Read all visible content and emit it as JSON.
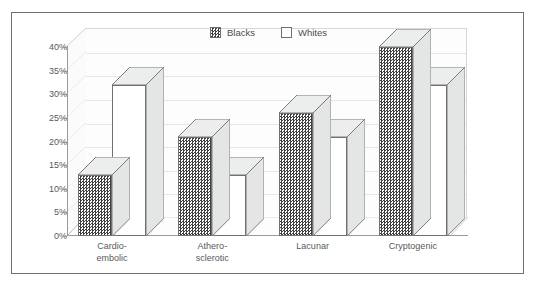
{
  "chart_data": {
    "type": "bar",
    "title": "",
    "subtitle": "",
    "xlabel": "",
    "ylabel": "",
    "categories": [
      "Cardio-\nembolic",
      "Athero-\nsclerotic",
      "Lacunar",
      "Cryptogenic"
    ],
    "series": [
      {
        "name": "Blacks",
        "values": [
          13,
          21,
          26,
          40
        ],
        "pattern": "checkered",
        "color": "#3f3f3f"
      },
      {
        "name": "Whites",
        "values": [
          32,
          13,
          21,
          32
        ],
        "pattern": "solid",
        "color": "#ffffff"
      }
    ],
    "ylim": [
      0,
      40
    ],
    "ytick_values": [
      40,
      35,
      30,
      25,
      20,
      15,
      10,
      5,
      0
    ],
    "ytick_labels": [
      "40%",
      "35%",
      "30%",
      "25%",
      "20%",
      "15%",
      "10%",
      "5%",
      "0%"
    ],
    "grid": true,
    "grid_axis": "y",
    "legend_position": "top-center",
    "style": "3d-clustered-column",
    "annotations": []
  },
  "legend": {
    "items": [
      {
        "label": "Blacks",
        "swatch": "checkered-swatch-icon"
      },
      {
        "label": "Whites",
        "swatch": "white-swatch-icon"
      }
    ]
  },
  "axes": {
    "y": {
      "ticks": [
        "40%",
        "35%",
        "30%",
        "25%",
        "20%",
        "15%",
        "10%",
        "5%",
        "0%"
      ]
    },
    "x": {
      "ticks": [
        "Cardio-\nembolic",
        "Athero-\nsclerotic",
        "Lacunar",
        "Cryptogenic"
      ]
    }
  },
  "colors": {
    "frame_border": "#6f6f6f",
    "gridline": "#e6e6e6",
    "axis_line": "#9a9a9a",
    "bar_outline": "#70716e",
    "bar_top_fill": "#eceded",
    "bar_side_fill": "#e4e5e5",
    "plot_background": "#fdfdfd",
    "text": "#58595b"
  }
}
